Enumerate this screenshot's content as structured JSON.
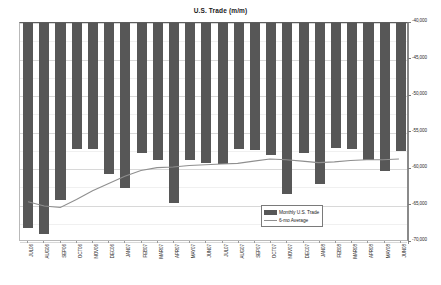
{
  "chart_data": {
    "type": "bar",
    "title": "U.S. Trade (m/m)",
    "xlabel": "",
    "ylabel": "",
    "ylim": [
      -70000,
      -40000
    ],
    "ytick_values": [
      -40000,
      -45000,
      -50000,
      -55000,
      -60000,
      -65000,
      -70000
    ],
    "ytick_labels": [
      "-40,000",
      "-45,000",
      "-50,000",
      "-55,000",
      "-60,000",
      "-65,000",
      "-70,000"
    ],
    "y_axis_position": "right",
    "grid": true,
    "legend_position": "lower-right",
    "categories": [
      "JUL06",
      "AUG06",
      "SEP06",
      "OCT06",
      "NOV06",
      "DEC06",
      "JAN07",
      "FEB07",
      "MAR07",
      "APR07",
      "MAY07",
      "JUN07",
      "JUL07",
      "AUG07",
      "SEP07",
      "OCT07",
      "NOV07",
      "DEC07",
      "JAN08",
      "FEB08",
      "MAR08",
      "APR08",
      "MAY08",
      "JUN08"
    ],
    "series": [
      {
        "name": "Monthly U.S. Trade",
        "type": "bar",
        "color": "#575757",
        "values": [
          -68100,
          -68900,
          -64200,
          -57200,
          -57300,
          -60700,
          -62600,
          -57800,
          -58700,
          -64700,
          -58700,
          -59200,
          -59300,
          -57300,
          -57400,
          -58100,
          -63400,
          -57800,
          -62000,
          -57100,
          -57200,
          -58700,
          -60300,
          -57500
        ]
      },
      {
        "name": "6-mo Average",
        "type": "line",
        "color": "#8f8f8f",
        "values": [
          -64700,
          -65300,
          -65500,
          -64400,
          -63200,
          -62200,
          -61200,
          -60400,
          -60000,
          -59900,
          -59700,
          -59600,
          -59500,
          -59400,
          -59100,
          -58800,
          -58900,
          -59100,
          -59300,
          -59200,
          -59000,
          -58900,
          -58900,
          -58800
        ]
      }
    ]
  },
  "legend": {
    "items": [
      {
        "label": "Monthly U.S. Trade",
        "marker": "bar-swatch"
      },
      {
        "label": "6-mo Average",
        "marker": "line-swatch"
      }
    ]
  }
}
